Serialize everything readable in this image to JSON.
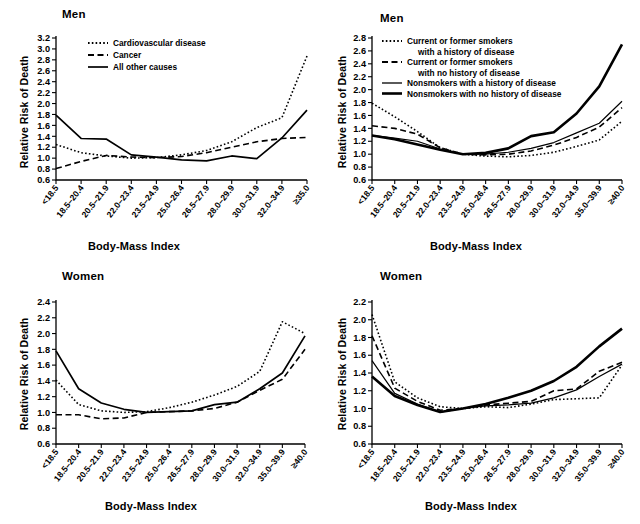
{
  "figure": {
    "axis_label_x": "Body-Mass Index",
    "axis_label_y": "Relative Risk of Death",
    "panel_title_men": "Men",
    "panel_title_women": "Women"
  },
  "chart_data": [
    {
      "id": "men-cause",
      "type": "line",
      "title": "Men",
      "xlabel": "Body-Mass Index",
      "ylabel": "Relative Risk of Death",
      "ylim": [
        0.6,
        3.2
      ],
      "ytick_step": 0.2,
      "yticks": [
        "3.2",
        "3.0",
        "2.8",
        "2.6",
        "2.4",
        "2.2",
        "2.0",
        "1.8",
        "1.6",
        "1.4",
        "1.2",
        "1.0",
        "0.8",
        "0.6"
      ],
      "grid": false,
      "legend_position": "top-left",
      "categories": [
        "<18.5",
        "18.5–20.4",
        "20.5–21.9",
        "22.0–23.4",
        "23.5–24.9",
        "25.0–26.4",
        "26.5–27.9",
        "28.0–29.9",
        "30.0–31.9",
        "32.0–34.9",
        "≥35.0"
      ],
      "series": [
        {
          "name": "Cardiovascular disease",
          "style": "dotted",
          "width": 1.6,
          "values": [
            1.25,
            1.1,
            1.04,
            1.0,
            1.01,
            1.06,
            1.14,
            1.3,
            1.56,
            1.74,
            2.87
          ]
        },
        {
          "name": "Cancer",
          "style": "dashed",
          "width": 1.6,
          "values": [
            0.81,
            0.94,
            1.05,
            1.02,
            1.01,
            1.03,
            1.1,
            1.2,
            1.3,
            1.36,
            1.38
          ]
        },
        {
          "name": "All other causes",
          "style": "solid",
          "width": 1.7,
          "values": [
            1.79,
            1.36,
            1.35,
            1.06,
            1.02,
            0.97,
            0.95,
            1.04,
            0.99,
            1.37,
            1.88
          ]
        }
      ]
    },
    {
      "id": "men-smoking",
      "type": "line",
      "title": "Men",
      "xlabel": "Body-Mass Index",
      "ylabel": "Relative Risk of Death",
      "ylim": [
        0.6,
        2.8
      ],
      "ytick_step": 0.2,
      "yticks": [
        "2.8",
        "2.6",
        "2.4",
        "2.2",
        "2.0",
        "1.8",
        "1.6",
        "1.4",
        "1.2",
        "1.0",
        "0.8",
        "0.6"
      ],
      "grid": false,
      "legend_position": "top-left",
      "categories": [
        "<18.5",
        "18.5–20.4",
        "20.5–21.9",
        "22.0–23.4",
        "23.5–24.9",
        "25.0–26.4",
        "26.5–27.9",
        "28.0–29.9",
        "30.0–31.9",
        "32.0–34.9",
        "35.0–39.9",
        "≥40.0"
      ],
      "series": [
        {
          "name": "Current or former smokers with a history of disease",
          "style": "dotted",
          "width": 1.6,
          "values": [
            1.79,
            1.58,
            1.35,
            1.1,
            1.0,
            0.97,
            0.96,
            0.98,
            1.03,
            1.12,
            1.22,
            1.51
          ]
        },
        {
          "name": "Current or former smokers with no history of disease",
          "style": "dashed",
          "width": 1.6,
          "values": [
            1.44,
            1.4,
            1.31,
            1.1,
            1.0,
            0.99,
            1.0,
            1.05,
            1.14,
            1.26,
            1.42,
            1.72
          ]
        },
        {
          "name": "Nonsmokers with a history of disease",
          "style": "solid",
          "width": 1.2,
          "values": [
            1.29,
            1.25,
            1.2,
            1.08,
            1.0,
            1.0,
            1.03,
            1.09,
            1.18,
            1.33,
            1.48,
            1.82
          ]
        },
        {
          "name": "Nonsmokers with no history of disease",
          "style": "solid",
          "width": 2.6,
          "values": [
            1.29,
            1.23,
            1.15,
            1.07,
            1.0,
            1.02,
            1.09,
            1.28,
            1.34,
            1.63,
            2.05,
            2.7
          ]
        }
      ]
    },
    {
      "id": "women-cause",
      "type": "line",
      "title": "Women",
      "xlabel": "Body-Mass Index",
      "ylabel": "Relative Risk of Death",
      "ylim": [
        0.6,
        2.4
      ],
      "ytick_step": 0.2,
      "yticks": [
        "2.4",
        "2.2",
        "2.0",
        "1.8",
        "1.6",
        "1.4",
        "1.2",
        "1.0",
        "0.8",
        "0.6"
      ],
      "grid": false,
      "legend_position": "none",
      "categories": [
        "<18.5",
        "18.5–20.4",
        "20.5–21.9",
        "22.0–23.4",
        "23.5–24.9",
        "25.0–26.4",
        "26.5–27.9",
        "28.0–29.9",
        "30.0–31.9",
        "32.0–34.9",
        "35.0–39.9",
        "≥40.0"
      ],
      "series": [
        {
          "name": "Cardiovascular disease",
          "style": "dotted",
          "width": 1.6,
          "values": [
            1.41,
            1.1,
            1.02,
            1.0,
            1.01,
            1.06,
            1.13,
            1.22,
            1.33,
            1.52,
            2.15,
            2.0
          ]
        },
        {
          "name": "Cancer",
          "style": "dashed",
          "width": 1.6,
          "values": [
            0.97,
            0.97,
            0.92,
            0.93,
            1.0,
            1.01,
            1.02,
            1.05,
            1.13,
            1.28,
            1.42,
            1.8
          ]
        },
        {
          "name": "All other causes",
          "style": "solid",
          "width": 1.7,
          "values": [
            1.78,
            1.3,
            1.12,
            1.04,
            1.0,
            1.01,
            1.02,
            1.1,
            1.13,
            1.3,
            1.5,
            1.97
          ]
        }
      ]
    },
    {
      "id": "women-smoking",
      "type": "line",
      "title": "Women",
      "xlabel": "Body-Mass Index",
      "ylabel": "Relative Risk of Death",
      "ylim": [
        0.6,
        2.2
      ],
      "ytick_step": 0.2,
      "yticks": [
        "2.2",
        "2.0",
        "1.8",
        "1.6",
        "1.4",
        "1.2",
        "1.0",
        "0.8",
        "0.6"
      ],
      "grid": false,
      "legend_position": "none",
      "categories": [
        "<18.5",
        "18.5–20.4",
        "20.5–21.9",
        "22.0–23.4",
        "23.5–24.9",
        "25.0–26.4",
        "26.5–27.9",
        "28.0–29.9",
        "30.0–31.9",
        "32.0–34.9",
        "35.0–39.9",
        "≥40.0"
      ],
      "series": [
        {
          "name": "Current or former smokers with a history of disease",
          "style": "dotted",
          "width": 1.6,
          "values": [
            2.06,
            1.3,
            1.12,
            1.02,
            1.0,
            1.02,
            1.01,
            1.05,
            1.1,
            1.11,
            1.12,
            1.49
          ]
        },
        {
          "name": "Current or former smokers with no history of disease",
          "style": "dashed",
          "width": 1.6,
          "values": [
            1.82,
            1.23,
            1.08,
            0.98,
            1.0,
            1.04,
            1.06,
            1.08,
            1.2,
            1.22,
            1.42,
            1.52
          ]
        },
        {
          "name": "Nonsmokers with a history of disease",
          "style": "solid",
          "width": 1.2,
          "values": [
            1.54,
            1.17,
            1.05,
            0.96,
            1.0,
            1.03,
            1.04,
            1.06,
            1.12,
            1.21,
            1.36,
            1.5
          ]
        },
        {
          "name": "Nonsmokers with no history of disease",
          "style": "solid",
          "width": 2.6,
          "values": [
            1.36,
            1.14,
            1.04,
            0.96,
            1.0,
            1.05,
            1.12,
            1.2,
            1.31,
            1.47,
            1.7,
            1.9
          ]
        }
      ]
    }
  ],
  "legends": {
    "cause": [
      {
        "label": "Cardiovascular disease",
        "style": "dotted"
      },
      {
        "label": "Cancer",
        "style": "dashed"
      },
      {
        "label": "All other causes",
        "style": "solid"
      }
    ],
    "smoking": [
      {
        "label": "Current or former smokers",
        "label2": "with a history of disease",
        "style": "dotted"
      },
      {
        "label": "Current or former smokers",
        "label2": "with no history of disease",
        "style": "dashed"
      },
      {
        "label": "Nonsmokers with a history of disease",
        "label2": "",
        "style": "solid-thin"
      },
      {
        "label": "Nonsmokers with no history of disease",
        "label2": "",
        "style": "solid-thick"
      }
    ]
  }
}
